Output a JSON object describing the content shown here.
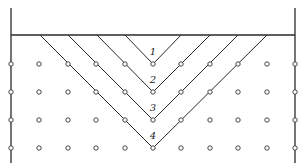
{
  "diagram": {
    "type": "wedge-failure-planes-with-anchor-grid",
    "colors": {
      "line": "#2a2a2a",
      "background": "#ffffff",
      "node_stroke": "#333333"
    },
    "frame": {
      "top_line_y": 35,
      "left_wall_x": 11,
      "right_wall_x": 295,
      "wall_top_y": 8,
      "wall_bottom_y": 163
    },
    "grid": {
      "columns_x": [
        11,
        39,
        68,
        96,
        125,
        153,
        181,
        210,
        238,
        267,
        295
      ],
      "rows_y": [
        64,
        92,
        120,
        148
      ]
    },
    "wedges": [
      {
        "label": "1",
        "left_x": 125,
        "right_x": 181,
        "apex_x": 153,
        "apex_y": 64,
        "label_y": 55
      },
      {
        "label": "2",
        "left_x": 97,
        "right_x": 210,
        "apex_x": 153,
        "apex_y": 92,
        "label_y": 83
      },
      {
        "label": "3",
        "left_x": 68,
        "right_x": 238,
        "apex_x": 153,
        "apex_y": 120,
        "label_y": 111
      },
      {
        "label": "4",
        "left_x": 40,
        "right_x": 267,
        "apex_x": 153,
        "apex_y": 148,
        "label_y": 139
      }
    ]
  }
}
